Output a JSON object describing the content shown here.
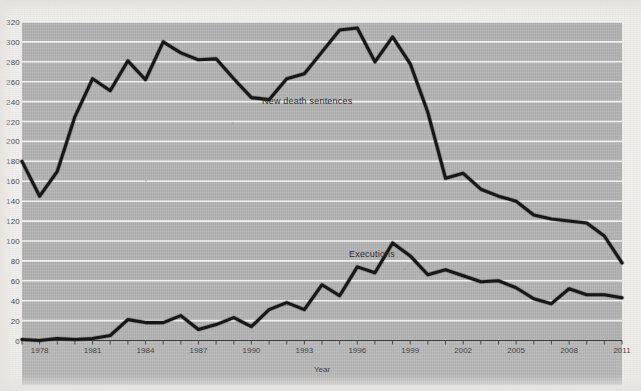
{
  "figure": {
    "media": "scanned-page-line-chart",
    "panel_color": "#b4b4b4",
    "gridline_color": "#f4f4f4",
    "line_color": "#171717"
  },
  "axes": {
    "y_ticks": [
      "320",
      "300",
      "280",
      "260",
      "240",
      "220",
      "200",
      "180",
      "160",
      "140",
      "120",
      "100",
      "80",
      "60",
      "40",
      "20",
      "0"
    ],
    "x_ticks": [
      "1978",
      "1981",
      "1984",
      "1987",
      "1990",
      "1993",
      "1996",
      "1999",
      "2002",
      "2005",
      "2008",
      "2011"
    ],
    "x_title": "Year",
    "y_title": ""
  },
  "labels": {
    "death_sentences": "New death sentences",
    "executions": "Executions"
  },
  "chart_data": {
    "type": "line",
    "title": "",
    "subtitle": "",
    "xlabel": "Year",
    "ylabel": "",
    "xlim": [
      1977,
      2011
    ],
    "ylim": [
      0,
      320
    ],
    "y_tick_step": 20,
    "grid": "horizontal",
    "legend": "inline-labels",
    "x": [
      1977,
      1978,
      1979,
      1980,
      1981,
      1982,
      1983,
      1984,
      1985,
      1986,
      1987,
      1988,
      1989,
      1990,
      1991,
      1992,
      1993,
      1994,
      1995,
      1996,
      1997,
      1998,
      1999,
      2000,
      2001,
      2002,
      2003,
      2004,
      2005,
      2006,
      2007,
      2008,
      2009,
      2010,
      2011
    ],
    "series": [
      {
        "name": "New death sentences",
        "label_text": "New death sentences",
        "values": [
          180,
          145,
          170,
          225,
          263,
          251,
          281,
          262,
          300,
          289,
          282,
          283,
          263,
          244,
          242,
          263,
          268,
          290,
          312,
          314,
          280,
          305,
          278,
          229,
          163,
          168,
          152,
          145,
          140,
          126,
          122,
          120,
          118,
          105,
          78
        ]
      },
      {
        "name": "Executions",
        "label_text": "Executions",
        "values": [
          1,
          0,
          2,
          1,
          2,
          5,
          21,
          18,
          18,
          25,
          11,
          16,
          23,
          14,
          31,
          38,
          31,
          56,
          45,
          74,
          68,
          98,
          85,
          66,
          71,
          65,
          59,
          60,
          53,
          42,
          37,
          52,
          46,
          46,
          43
        ]
      }
    ]
  }
}
